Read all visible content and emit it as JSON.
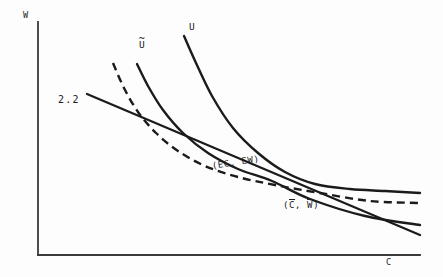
{
  "figure": {
    "background_color": "#fdfdfd",
    "ink_color": "#1b1b1b",
    "axis_color": "#3a3a3a"
  },
  "axes": {
    "y_label": "W",
    "x_label": "C",
    "origin": [
      38,
      255
    ],
    "y_top": [
      38,
      22
    ],
    "x_right": [
      420,
      255
    ]
  },
  "labels": {
    "budget_line": "2.2",
    "curve_u": "U",
    "curve_u_tilde_base": "U",
    "curve_u_tilde_mark": "~",
    "point_expected": "(EC,  EW)",
    "point_certain_open": "(",
    "point_certain_c": "C",
    "point_certain_sep": ",  ",
    "point_certain_w": "W",
    "point_certain_close": ")"
  },
  "chart_data": {
    "type": "line",
    "title": "",
    "xlabel": "C",
    "ylabel": "W",
    "grid": false,
    "legend": "none",
    "xlim": [
      38,
      443
    ],
    "ylim": [
      277,
      0
    ],
    "note": "Indifference-curve diagram in screen pixel coordinates; y grows downward.",
    "series": [
      {
        "name": "2.2",
        "style": "solid-straight",
        "label_pos": [
          58,
          100
        ],
        "points": [
          [
            87,
            94
          ],
          [
            420,
            235
          ]
        ]
      },
      {
        "name": "U",
        "style": "solid-convex",
        "label_pos": [
          190,
          25
        ],
        "points": [
          [
            184,
            36
          ],
          [
            196,
            63
          ],
          [
            212,
            96
          ],
          [
            233,
            128
          ],
          [
            258,
            153
          ],
          [
            285,
            172
          ],
          [
            315,
            184
          ],
          [
            350,
            189
          ],
          [
            385,
            191
          ],
          [
            420,
            193
          ]
        ]
      },
      {
        "name": "U-tilde",
        "style": "solid-convex",
        "label_pos": [
          140,
          41
        ],
        "points": [
          [
            137,
            64
          ],
          [
            148,
            86
          ],
          [
            163,
            110
          ],
          [
            183,
            133
          ],
          [
            208,
            153
          ],
          [
            238,
            169
          ],
          [
            272,
            181
          ],
          [
            310,
            199
          ],
          [
            365,
            216
          ],
          [
            420,
            225
          ]
        ]
      },
      {
        "name": "bar-curve",
        "style": "dashed-convex",
        "label_pos": [
          291,
          206
        ],
        "points": [
          [
            113,
            63
          ],
          [
            124,
            88
          ],
          [
            138,
            112
          ],
          [
            156,
            133
          ],
          [
            178,
            151
          ],
          [
            205,
            166
          ],
          [
            238,
            177
          ],
          [
            275,
            185
          ],
          [
            320,
            193
          ],
          [
            370,
            201
          ],
          [
            420,
            203
          ]
        ]
      }
    ],
    "annotations": [
      {
        "text": "(EC,  EW)",
        "x": 213,
        "y": 168,
        "rotation": -9
      },
      {
        "text": "(C̄,  W̄)",
        "x": 284,
        "y": 207,
        "rotation": 0
      }
    ],
    "key_points": [
      {
        "name": "tangency-bar-line",
        "x": 170,
        "y": 128
      },
      {
        "name": "crossing-cluster",
        "x": 300,
        "y": 186
      }
    ]
  }
}
